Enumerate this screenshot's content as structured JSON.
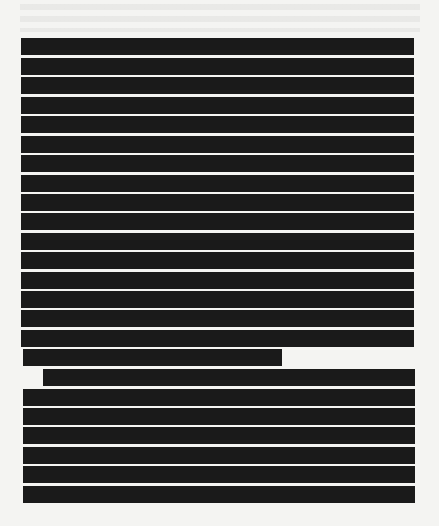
{
  "document": {
    "type": "redacted-page",
    "background_color": "#f4f4f2",
    "redaction_color": "#1a1a1a",
    "redaction_bars": [
      {
        "x": 21,
        "y": 38,
        "w": 393
      },
      {
        "x": 21,
        "y": 58,
        "w": 393
      },
      {
        "x": 21,
        "y": 77,
        "w": 393
      },
      {
        "x": 21,
        "y": 97,
        "w": 393
      },
      {
        "x": 21,
        "y": 116,
        "w": 393
      },
      {
        "x": 21,
        "y": 136,
        "w": 393
      },
      {
        "x": 21,
        "y": 155,
        "w": 393
      },
      {
        "x": 21,
        "y": 175,
        "w": 393
      },
      {
        "x": 21,
        "y": 194,
        "w": 393
      },
      {
        "x": 21,
        "y": 213,
        "w": 393
      },
      {
        "x": 21,
        "y": 233,
        "w": 393
      },
      {
        "x": 21,
        "y": 252,
        "w": 393
      },
      {
        "x": 21,
        "y": 272,
        "w": 393
      },
      {
        "x": 21,
        "y": 291,
        "w": 393
      },
      {
        "x": 21,
        "y": 310,
        "w": 393
      },
      {
        "x": 21,
        "y": 330,
        "w": 393
      },
      {
        "x": 23,
        "y": 349,
        "w": 259
      },
      {
        "x": 43,
        "y": 369,
        "w": 372
      },
      {
        "x": 23,
        "y": 389,
        "w": 392
      },
      {
        "x": 23,
        "y": 408,
        "w": 392
      },
      {
        "x": 23,
        "y": 427,
        "w": 392
      },
      {
        "x": 23,
        "y": 447,
        "w": 392
      },
      {
        "x": 23,
        "y": 466,
        "w": 392
      },
      {
        "x": 23,
        "y": 486,
        "w": 392
      }
    ]
  }
}
